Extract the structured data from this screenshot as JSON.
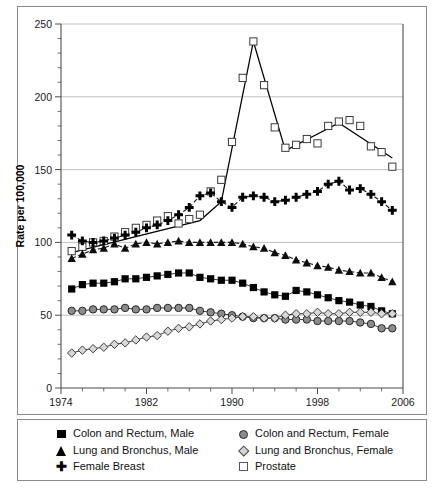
{
  "chart_data": {
    "type": "line",
    "title": "",
    "xlabel": "Year of diagnosis",
    "ylabel": "Rate per 100,000",
    "xlim": [
      1974,
      2006
    ],
    "ylim": [
      0,
      250
    ],
    "ytick_values": [
      0,
      50,
      100,
      150,
      200,
      250
    ],
    "ytick_labels": [
      "0",
      "50",
      "100",
      "150",
      "200",
      "250"
    ],
    "xtick_values": [
      1974,
      1982,
      1990,
      1998,
      2006
    ],
    "xtick_labels": [
      "1974",
      "1982",
      "1990",
      "1998",
      "2006"
    ],
    "x_minor_step": 2,
    "y_minor_step": 10,
    "grid": "horizontal-major",
    "legend_position": "bottom",
    "x": [
      1975,
      1976,
      1977,
      1978,
      1979,
      1980,
      1981,
      1982,
      1983,
      1984,
      1985,
      1986,
      1987,
      1988,
      1989,
      1990,
      1991,
      1992,
      1993,
      1994,
      1995,
      1996,
      1997,
      1998,
      1999,
      2000,
      2001,
      2002,
      2003,
      2004,
      2005
    ],
    "series": [
      {
        "name": "Prostate",
        "marker": "open-square",
        "color": "#000000",
        "line": "solid",
        "values": [
          94,
          97,
          100,
          101,
          104,
          107,
          110,
          112,
          115,
          118,
          113,
          116,
          119,
          135,
          143,
          169,
          213,
          238,
          208,
          179,
          165,
          167,
          171,
          168,
          180,
          183,
          184,
          180,
          166,
          162,
          152
        ]
      },
      {
        "name": "Female Breast",
        "marker": "plus",
        "color": "#000000",
        "line": "dashed",
        "values": [
          105,
          101,
          100,
          101,
          103,
          105,
          107,
          110,
          112,
          115,
          119,
          124,
          132,
          134,
          128,
          124,
          131,
          132,
          131,
          128,
          129,
          131,
          133,
          135,
          140,
          142,
          136,
          137,
          133,
          128,
          122
        ]
      },
      {
        "name": "Lung and Bronchus, Male",
        "marker": "filled-triangle",
        "color": "#111111",
        "line": "dashed",
        "values": [
          89,
          92,
          95,
          96,
          99,
          96,
          99,
          100,
          99,
          100,
          101,
          100,
          100,
          100,
          100,
          100,
          99,
          97,
          96,
          93,
          91,
          88,
          86,
          84,
          83,
          81,
          80,
          79,
          79,
          76,
          73
        ]
      },
      {
        "name": "Colon and Rectum, Male",
        "marker": "filled-square",
        "color": "#000000",
        "line": "solid",
        "values": [
          68,
          71,
          72,
          72,
          73,
          75,
          75,
          76,
          77,
          78,
          79,
          79,
          76,
          75,
          74,
          74,
          72,
          69,
          66,
          64,
          63,
          67,
          66,
          64,
          62,
          60,
          59,
          57,
          56,
          53,
          51
        ]
      },
      {
        "name": "Colon and Rectum, Female",
        "marker": "filled-circle",
        "color": "#8c8c8c",
        "line": "solid",
        "values": [
          53,
          53,
          54,
          54,
          54,
          55,
          54,
          54,
          55,
          55,
          55,
          55,
          53,
          52,
          51,
          50,
          49,
          48,
          48,
          48,
          47,
          47,
          47,
          46,
          46,
          46,
          46,
          45,
          44,
          41,
          41
        ]
      },
      {
        "name": "Lung and Bronchus, Female",
        "marker": "open-diamond",
        "color": "#d4d4d4",
        "line": "solid",
        "values": [
          24,
          26,
          27,
          28,
          30,
          31,
          33,
          35,
          36,
          39,
          41,
          42,
          44,
          46,
          47,
          48,
          49,
          49,
          48,
          48,
          50,
          51,
          51,
          52,
          51,
          51,
          52,
          52,
          52,
          51,
          51
        ]
      }
    ],
    "prostate_trend_line": [
      {
        "x": 1975,
        "y": 93
      },
      {
        "x": 1987,
        "y": 115
      },
      {
        "x": 1989,
        "y": 128
      },
      {
        "x": 1992,
        "y": 238
      },
      {
        "x": 1995,
        "y": 163
      },
      {
        "x": 2000,
        "y": 182
      },
      {
        "x": 2005,
        "y": 158
      }
    ]
  },
  "legend": {
    "items": [
      {
        "label": "Colon and Rectum, Male",
        "marker": "filled-square",
        "col": "left"
      },
      {
        "label": "Lung and Bronchus, Male",
        "marker": "filled-triangle",
        "col": "left"
      },
      {
        "label": "Female Breast",
        "marker": "plus",
        "col": "left"
      },
      {
        "label": "Colon and Rectum, Female",
        "marker": "filled-circle",
        "col": "right"
      },
      {
        "label": "Lung and Bronchus, Female",
        "marker": "open-diamond",
        "col": "right"
      },
      {
        "label": "Prostate",
        "marker": "open-square",
        "col": "right"
      }
    ]
  }
}
